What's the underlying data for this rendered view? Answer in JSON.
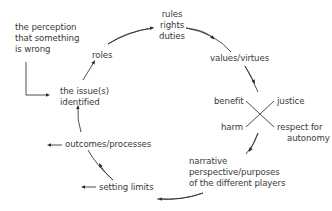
{
  "diagram": {
    "type": "cycle",
    "trigger": {
      "lines": [
        "the perception",
        "that something",
        "is wrong"
      ]
    },
    "nodes": [
      {
        "id": "issue",
        "lines": [
          "the issue(s)",
          "identified"
        ]
      },
      {
        "id": "roles",
        "lines": [
          "roles"
        ]
      },
      {
        "id": "rules",
        "lines": [
          "rules",
          "rights",
          "duties"
        ]
      },
      {
        "id": "values",
        "lines": [
          "values/virtues"
        ]
      },
      {
        "id": "principles",
        "quadrants": {
          "top_left": "benefit",
          "top_right": "justice",
          "bottom_left": "harm",
          "bottom_right": [
            "respect for",
            "autonomy"
          ]
        }
      },
      {
        "id": "narrative",
        "lines": [
          "narrative",
          "perspective/purposes",
          "of the different players"
        ]
      },
      {
        "id": "limits",
        "lines": [
          "setting limits"
        ]
      },
      {
        "id": "outcomes",
        "lines": [
          "outcomes/processes"
        ]
      }
    ],
    "edges": [
      {
        "from": "trigger",
        "to": "issue",
        "style": "elbow"
      },
      {
        "from": "issue",
        "to": "roles"
      },
      {
        "from": "roles",
        "to": "rules"
      },
      {
        "from": "rules",
        "to": "values"
      },
      {
        "from": "values",
        "to": "principles"
      },
      {
        "from": "principles",
        "to": "narrative"
      },
      {
        "from": "narrative",
        "to": "limits"
      },
      {
        "from": "limits",
        "to": "outcomes"
      },
      {
        "from": "outcomes",
        "to": "issue"
      }
    ],
    "colors": {
      "text": "#3a3a3a",
      "line": "#3a3a3a",
      "background": "#ffffff"
    }
  }
}
